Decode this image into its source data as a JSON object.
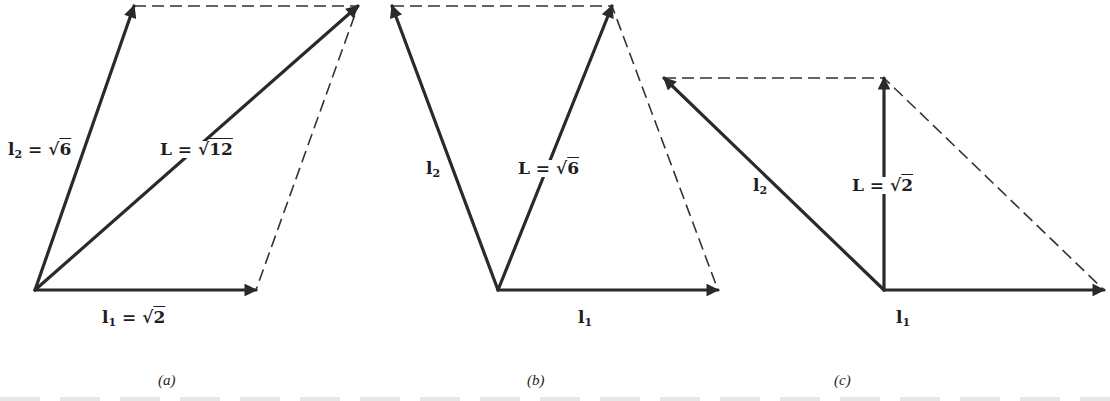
{
  "figure": {
    "panels": [
      {
        "id": "a",
        "caption": "(a)",
        "origin": [
          35,
          290
        ],
        "vectors": {
          "l1": {
            "end": [
              256,
              290
            ],
            "label_sym": "l",
            "label_sub": "1",
            "label_eq": " = √",
            "label_val": "2"
          },
          "l2": {
            "end": [
              134,
              6
            ],
            "label_sym": "l",
            "label_sub": "2",
            "label_eq": " = √",
            "label_val": "6"
          },
          "L": {
            "end": [
              358,
              6
            ],
            "label_sym": "L",
            "label_eq": " = √",
            "label_val": "12"
          }
        },
        "parallelogram_dashed": [
          [
            134,
            6
          ],
          [
            358,
            6
          ],
          [
            256,
            290
          ]
        ]
      },
      {
        "id": "b",
        "caption": "(b)",
        "origin": [
          498,
          290
        ],
        "vectors": {
          "l1": {
            "end": [
              718,
              290
            ],
            "label_sym": "l",
            "label_sub": "1"
          },
          "l2": {
            "end": [
              392,
              6
            ],
            "label_sym": "l",
            "label_sub": "2"
          },
          "L": {
            "end": [
              612,
              6
            ],
            "label_sym": "L",
            "label_eq": " = √",
            "label_val": "6"
          }
        },
        "parallelogram_dashed": [
          [
            392,
            6
          ],
          [
            612,
            6
          ],
          [
            718,
            290
          ]
        ]
      },
      {
        "id": "c",
        "caption": "(c)",
        "origin": [
          884,
          290
        ],
        "vectors": {
          "l1": {
            "end": [
              1104,
              290
            ],
            "label_sym": "l",
            "label_sub": "1"
          },
          "l2": {
            "end": [
              664,
              78
            ],
            "label_sym": "l",
            "label_sub": "2"
          },
          "L": {
            "end": [
              884,
              78
            ],
            "label_sym": "L",
            "label_eq": " = √",
            "label_val": "2"
          }
        },
        "parallelogram_dashed": [
          [
            664,
            78
          ],
          [
            884,
            78
          ],
          [
            1104,
            290
          ]
        ]
      }
    ],
    "colors": {
      "ink": "#2a2a2a",
      "background": "#ffffff"
    }
  }
}
